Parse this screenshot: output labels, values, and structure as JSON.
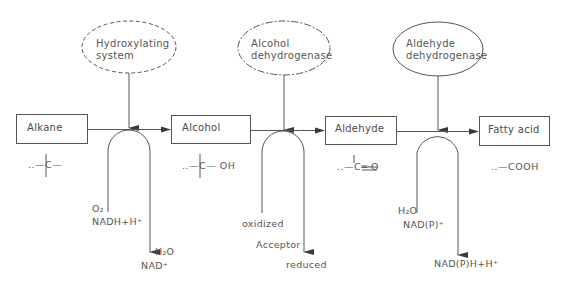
{
  "diagram": {
    "type": "biochemical-pathway",
    "colors": {
      "stroke": "#555555",
      "text": "#4a4a4a",
      "background": "#ffffff"
    },
    "enzymes": [
      {
        "id": "e1",
        "line1": "Hydroxylating",
        "line2": "system",
        "border": "dashed"
      },
      {
        "id": "e2",
        "line1": "Alcohol",
        "line2": "dehydrogenase",
        "border": "dash-dot"
      },
      {
        "id": "e3",
        "line1": "Aldehyde",
        "line2": "dehydrogenase",
        "border": "solid"
      }
    ],
    "compounds": [
      {
        "id": "c1",
        "label": "Alkane",
        "formula": "..—C—"
      },
      {
        "id": "c2",
        "label": "Alcohol",
        "formula": "..—C— OH"
      },
      {
        "id": "c3",
        "label": "Aldehyde",
        "formula": "..—C═ O"
      },
      {
        "id": "c4",
        "label": "Fatty acid",
        "formula": "..—COOH"
      }
    ],
    "cofactors": [
      {
        "step": 1,
        "in_line1": "O₂",
        "in_line2": "NADH+H⁺",
        "out_line1": "H₂O",
        "out_line2": "NAD⁺"
      },
      {
        "step": 2,
        "in_line1": "oxidized",
        "in_line2": "Acceptor",
        "out_line1": "reduced"
      },
      {
        "step": 3,
        "in_line1": "H₂O",
        "in_line2": "NAD(P)⁺",
        "out_line1": "NAD(P)H+H⁺"
      }
    ]
  }
}
